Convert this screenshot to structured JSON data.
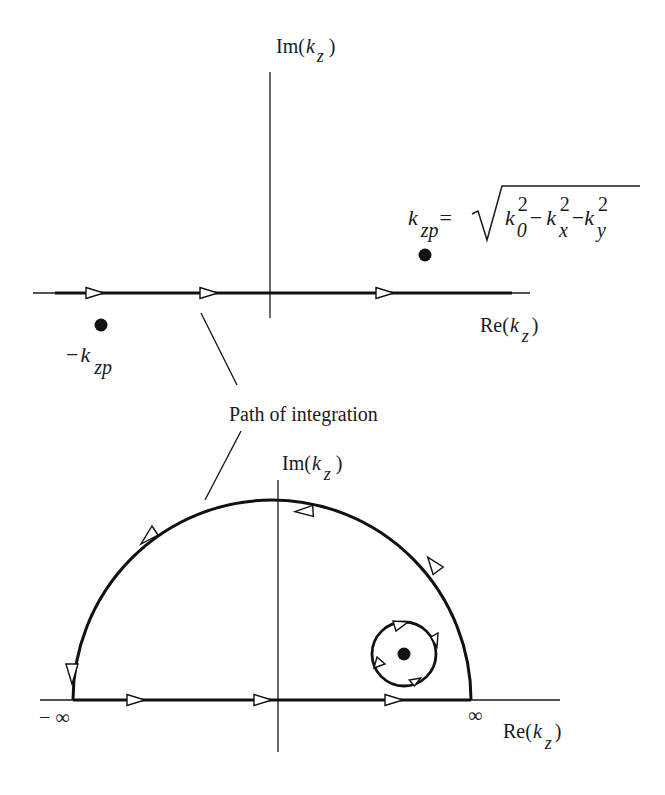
{
  "top_plane": {
    "im_axis": {
      "prefix": "Im(",
      "var": "k",
      "sub": "z",
      "suffix": ")"
    },
    "re_axis": {
      "prefix": "Re(",
      "var": "k",
      "sub": "z",
      "suffix": ")"
    },
    "pole_positive": {
      "var": "k",
      "sub": "zp",
      "equals": "=",
      "sqrt_terms": [
        {
          "var": "k",
          "sub": "0",
          "sup": "2"
        },
        {
          "op": "−"
        },
        {
          "var": "k",
          "sub": "x",
          "sup": "2"
        },
        {
          "op": "−"
        },
        {
          "var": "k",
          "sub": "y",
          "sup": "2"
        }
      ]
    },
    "pole_negative": {
      "sign": "−",
      "var": "k",
      "sub": "zp"
    }
  },
  "annotation": {
    "label": "Path of integration"
  },
  "bottom_plane": {
    "im_axis": {
      "prefix": "Im(",
      "var": "k",
      "sub": "z",
      "suffix": ")"
    },
    "re_axis": {
      "prefix": "Re(",
      "var": "k",
      "sub": "z",
      "suffix": ")"
    },
    "left_limit": "− ∞",
    "right_limit": "∞"
  },
  "colors": {
    "ink": "#111111",
    "background": "#ffffff"
  }
}
